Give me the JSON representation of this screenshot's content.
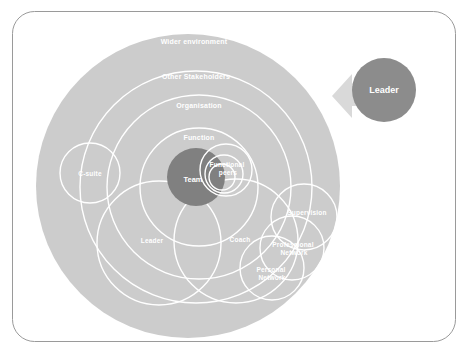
{
  "canvas": {
    "width": 468,
    "height": 363,
    "background": "#ffffff",
    "frame": {
      "stroke": "#999999",
      "radius": 22
    }
  },
  "colors": {
    "outer_disc": "#cccccc",
    "ring_stroke": "#ffffff",
    "core_team": "#808080",
    "leader_circle": "#8c8c8c",
    "arrow": "#d9d9d9",
    "label_text": "#ffffff"
  },
  "diagram": {
    "rings": [
      {
        "label": "Wider environment",
        "cx": 188,
        "cy": 186,
        "r": 152,
        "label_x": 194,
        "label_y": 42
      },
      {
        "label": "Other Stakeholders",
        "cx": 196,
        "cy": 187,
        "r": 116,
        "label_x": 196,
        "label_y": 77
      },
      {
        "label": "Organisation",
        "cx": 199,
        "cy": 187,
        "r": 92,
        "label_x": 199,
        "label_y": 106
      },
      {
        "label": "Function",
        "cx": 199,
        "cy": 187,
        "r": 59,
        "label_x": 199,
        "label_y": 138
      }
    ],
    "core": {
      "label": "Team",
      "cx": 196,
      "cy": 177,
      "r": 29,
      "label_x": 193,
      "label_y": 180
    },
    "nodes": [
      {
        "name": "c-suite",
        "label": "C-suite",
        "lines": [
          "C-suite"
        ],
        "cx": 90,
        "cy": 173,
        "r": 30,
        "label_x": 90,
        "label_y": 174
      },
      {
        "name": "functional-peers",
        "label": "Functional peers",
        "lines": [
          "Functional",
          "peers"
        ],
        "cx": 226,
        "cy": 170,
        "r": 26,
        "label_x": 228,
        "label_y": 165
      },
      {
        "name": "leader",
        "label": "Leader",
        "lines": [
          "Leader"
        ],
        "cx": 159,
        "cy": 243,
        "r": 62,
        "label_x": 152,
        "label_y": 241
      },
      {
        "name": "coach",
        "label": "Coach",
        "lines": [
          "Coach"
        ],
        "cx": 236,
        "cy": 241,
        "r": 62,
        "label_x": 240,
        "label_y": 240
      },
      {
        "name": "supervision",
        "label": "Supervision",
        "lines": [
          "Supervision"
        ],
        "cx": 304,
        "cy": 217,
        "r": 33,
        "label_x": 307,
        "label_y": 213
      },
      {
        "name": "professional-network",
        "label": "Professional Network",
        "lines": [
          "Professional",
          "Network"
        ],
        "cx": 292,
        "cy": 248,
        "r": 32,
        "label_x": 294,
        "label_y": 245
      },
      {
        "name": "personal-network",
        "label": "Personal Network",
        "lines": [
          "Personal",
          "Network"
        ],
        "cx": 272,
        "cy": 268,
        "r": 32,
        "label_x": 272,
        "label_y": 270
      }
    ],
    "callout": {
      "label": "Leader",
      "cx": 384,
      "cy": 90,
      "r": 32,
      "label_x": 384,
      "label_y": 91
    },
    "arrow": {
      "name": "leader-pointer-arrow",
      "direction": "left",
      "points": "352,86 352,76 333,96 352,116 352,106 362,106 362,86"
    }
  }
}
